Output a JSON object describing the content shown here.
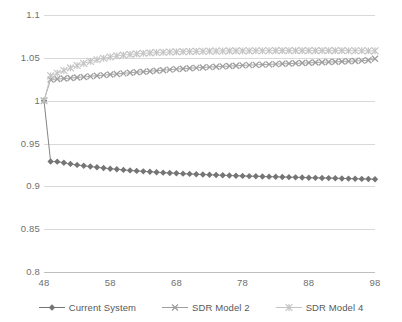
{
  "chart_data": {
    "type": "line",
    "title": "",
    "subtitle": "",
    "xlabel": "",
    "ylabel": "",
    "xlim": [
      48,
      98
    ],
    "ylim": [
      0.8,
      1.1
    ],
    "grid": true,
    "legend_position": "bottom",
    "x_ticks": [
      48,
      58,
      68,
      78,
      88,
      98
    ],
    "x_tick_labels": [
      "48",
      "58",
      "68",
      "78",
      "88",
      "98"
    ],
    "y_ticks": [
      0.8,
      0.85,
      0.9,
      0.95,
      1.0,
      1.05,
      1.1
    ],
    "y_tick_labels": [
      "0.8",
      "0.85",
      "0.9",
      "0.95",
      "1",
      "1.05",
      "1.1"
    ],
    "x": [
      48,
      49,
      50,
      51,
      52,
      53,
      54,
      55,
      56,
      57,
      58,
      59,
      60,
      61,
      62,
      63,
      64,
      65,
      66,
      67,
      68,
      69,
      70,
      71,
      72,
      73,
      74,
      75,
      76,
      77,
      78,
      79,
      80,
      81,
      82,
      83,
      84,
      85,
      86,
      87,
      88,
      89,
      90,
      91,
      92,
      93,
      94,
      95,
      96,
      97,
      98
    ],
    "series": [
      {
        "name": "Current System",
        "color": "#757575",
        "marker": "diamond",
        "values": [
          1.0,
          0.929,
          0.9288,
          0.9275,
          0.9262,
          0.925,
          0.924,
          0.9231,
          0.9222,
          0.9214,
          0.9206,
          0.9199,
          0.9192,
          0.9186,
          0.918,
          0.9175,
          0.917,
          0.9165,
          0.916,
          0.9156,
          0.9152,
          0.9148,
          0.9145,
          0.9141,
          0.9138,
          0.9135,
          0.9132,
          0.9129,
          0.9127,
          0.9124,
          0.9122,
          0.9119,
          0.9117,
          0.9115,
          0.9113,
          0.9111,
          0.9109,
          0.9107,
          0.9105,
          0.9103,
          0.9101,
          0.9099,
          0.9097,
          0.9096,
          0.9094,
          0.9092,
          0.909,
          0.9089,
          0.9087,
          0.9085,
          0.9083
        ]
      },
      {
        "name": "SDR Model 2",
        "color": "#9e9e9e",
        "marker": "x",
        "values": [
          1.0,
          1.0248,
          1.0252,
          1.0258,
          1.0264,
          1.027,
          1.0277,
          1.0284,
          1.0291,
          1.0298,
          1.0305,
          1.0312,
          1.0319,
          1.0326,
          1.0332,
          1.0338,
          1.0344,
          1.035,
          1.0356,
          1.0362,
          1.0368,
          1.0373,
          1.0378,
          1.0383,
          1.0388,
          1.0392,
          1.0396,
          1.04,
          1.0404,
          1.0408,
          1.0412,
          1.0415,
          1.0418,
          1.0421,
          1.0424,
          1.0427,
          1.043,
          1.0433,
          1.0436,
          1.0439,
          1.0442,
          1.0445,
          1.0448,
          1.0451,
          1.0454,
          1.0457,
          1.046,
          1.0463,
          1.0467,
          1.0471,
          1.049
        ]
      },
      {
        "name": "SDR Model 4",
        "color": "#c4c4c4",
        "marker": "asterisk",
        "values": [
          1.0,
          1.029,
          1.032,
          1.0352,
          1.0382,
          1.041,
          1.0436,
          1.0458,
          1.0478,
          1.0495,
          1.051,
          1.0522,
          1.0532,
          1.054,
          1.0547,
          1.0553,
          1.0558,
          1.0562,
          1.0565,
          1.0568,
          1.057,
          1.0572,
          1.0574,
          1.0576,
          1.0577,
          1.0578,
          1.0579,
          1.058,
          1.0581,
          1.0581,
          1.0582,
          1.0582,
          1.0583,
          1.0583,
          1.0583,
          1.0584,
          1.0584,
          1.0584,
          1.0584,
          1.0584,
          1.0584,
          1.0584,
          1.0584,
          1.0584,
          1.0584,
          1.0584,
          1.0583,
          1.0583,
          1.0583,
          1.0582,
          1.0582
        ]
      }
    ]
  },
  "legend": {
    "items": [
      {
        "label": "Current System"
      },
      {
        "label": "SDR Model 2"
      },
      {
        "label": "SDR Model 4"
      }
    ]
  }
}
